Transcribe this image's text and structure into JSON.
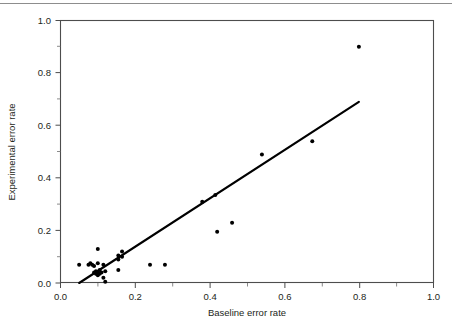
{
  "figure": {
    "top_rule": "horizontal-rule"
  },
  "chart_data": {
    "type": "scatter",
    "title": "",
    "xlabel": "Baseline error rate",
    "ylabel": "Experimental error rate",
    "xlim": [
      0.0,
      1.0
    ],
    "ylim": [
      0.0,
      1.0
    ],
    "xticks": [
      0.0,
      0.2,
      0.4,
      0.6,
      0.8,
      1.0
    ],
    "xtick_labels": [
      "0.0",
      "0.2",
      "0.4",
      "0.6",
      "0.8",
      "1.0"
    ],
    "yticks": [
      0.0,
      0.2,
      0.4,
      0.6,
      0.8,
      1.0
    ],
    "ytick_labels": [
      "0.0",
      "0.2",
      "0.4",
      "0.6",
      "0.8",
      "1.0"
    ],
    "minor_xticks": [
      0.1,
      0.3,
      0.5,
      0.7,
      0.9
    ],
    "minor_yticks": [
      0.1,
      0.3,
      0.5,
      0.7,
      0.9
    ],
    "grid": false,
    "legend": null,
    "marker": "filled-circle",
    "marker_color": "#000000",
    "points": [
      {
        "x": 0.05,
        "y": 0.07
      },
      {
        "x": 0.075,
        "y": 0.07
      },
      {
        "x": 0.08,
        "y": 0.075
      },
      {
        "x": 0.085,
        "y": 0.07
      },
      {
        "x": 0.09,
        "y": 0.065
      },
      {
        "x": 0.09,
        "y": 0.04
      },
      {
        "x": 0.095,
        "y": 0.035
      },
      {
        "x": 0.095,
        "y": 0.045
      },
      {
        "x": 0.1,
        "y": 0.13
      },
      {
        "x": 0.1,
        "y": 0.075
      },
      {
        "x": 0.1,
        "y": 0.04
      },
      {
        "x": 0.1,
        "y": 0.03
      },
      {
        "x": 0.105,
        "y": 0.05
      },
      {
        "x": 0.105,
        "y": 0.035
      },
      {
        "x": 0.11,
        "y": 0.04
      },
      {
        "x": 0.115,
        "y": 0.07
      },
      {
        "x": 0.115,
        "y": 0.02
      },
      {
        "x": 0.12,
        "y": 0.045
      },
      {
        "x": 0.12,
        "y": 0.005
      },
      {
        "x": 0.155,
        "y": 0.105
      },
      {
        "x": 0.155,
        "y": 0.09
      },
      {
        "x": 0.155,
        "y": 0.05
      },
      {
        "x": 0.165,
        "y": 0.12
      },
      {
        "x": 0.165,
        "y": 0.1
      },
      {
        "x": 0.24,
        "y": 0.07
      },
      {
        "x": 0.28,
        "y": 0.07
      },
      {
        "x": 0.38,
        "y": 0.31
      },
      {
        "x": 0.415,
        "y": 0.335
      },
      {
        "x": 0.42,
        "y": 0.195
      },
      {
        "x": 0.46,
        "y": 0.23
      },
      {
        "x": 0.54,
        "y": 0.49
      },
      {
        "x": 0.675,
        "y": 0.54
      },
      {
        "x": 0.8,
        "y": 0.9
      }
    ],
    "fit_line": {
      "name": "regression-line",
      "color": "#000000",
      "x0": 0.05,
      "y0": 0.0,
      "x1": 0.8,
      "y1": 0.69
    }
  }
}
